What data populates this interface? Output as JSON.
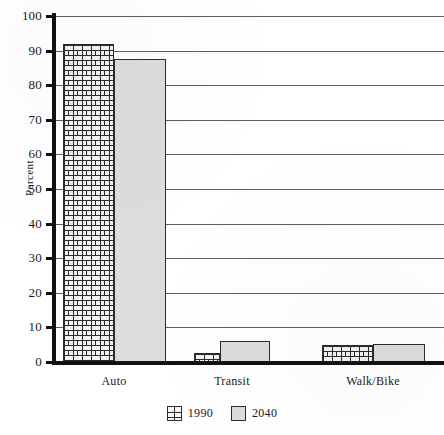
{
  "chart_data": {
    "type": "bar",
    "title": "",
    "xlabel": "",
    "ylabel": "Percent",
    "ylim": [
      0,
      100
    ],
    "ytick_step": 10,
    "yticks": [
      100,
      90,
      80,
      70,
      60,
      50,
      40,
      30,
      20,
      10,
      0
    ],
    "categories": [
      "Auto",
      "Transit",
      "Walk/Bike"
    ],
    "series": [
      {
        "name": "1990",
        "values": [
          92,
          2.5,
          5
        ],
        "pattern": "brick",
        "color": "#f2f2f2"
      },
      {
        "name": "2040",
        "values": [
          87.5,
          6,
          5.3
        ],
        "pattern": "solid",
        "color": "#dcdcdc"
      }
    ],
    "legend_position": "bottom-center",
    "grid": "horizontal",
    "axis_color": "#111111",
    "gridline_color": "#5d5d5d",
    "bar_border_color": "#2b2b2b"
  },
  "legend": {
    "items": [
      {
        "label": "1990",
        "swatch": "brick-pattern-swatch"
      },
      {
        "label": "2040",
        "swatch": "gray-solid-swatch"
      }
    ]
  }
}
